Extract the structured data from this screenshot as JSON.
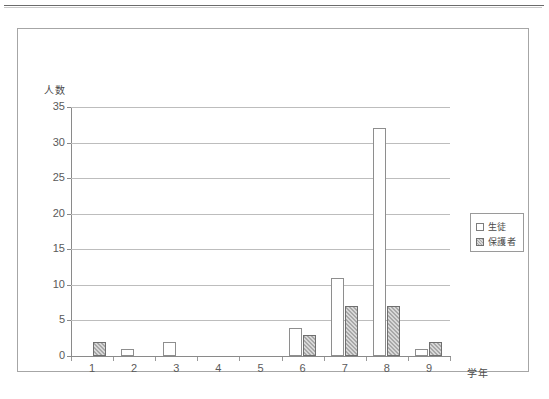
{
  "chart_data": {
    "type": "bar",
    "title": "",
    "xlabel": "学年",
    "ylabel": "人数",
    "categories": [
      "1",
      "2",
      "3",
      "4",
      "5",
      "6",
      "7",
      "8",
      "9"
    ],
    "series": [
      {
        "name": "生徒",
        "values": [
          0,
          1,
          2,
          0,
          0,
          4,
          11,
          32,
          1
        ]
      },
      {
        "name": "保護者",
        "values": [
          2,
          0,
          0,
          0,
          0,
          3,
          7,
          7,
          2
        ]
      }
    ],
    "ylim": [
      0,
      35
    ],
    "y_ticks": [
      "0",
      "5",
      "10",
      "15",
      "20",
      "25",
      "30",
      "35"
    ],
    "grid": true,
    "legend_position": "right"
  },
  "legend": {
    "entries": [
      {
        "label": "生徒"
      },
      {
        "label": "保護者"
      }
    ]
  },
  "colors": {
    "series_0_fill": "#ffffff",
    "series_0_border": "#8e8e8e",
    "series_1_fill": "#a8a8a8",
    "series_1_border": "#6f6f6f",
    "gridline": "#bdbdbd",
    "axis": "#8a8a8a",
    "frame": "#a6a6a6"
  }
}
